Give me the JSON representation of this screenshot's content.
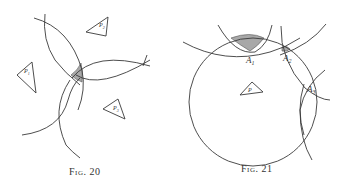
{
  "figures": [
    {
      "caption": "Fig. 20",
      "triangles": [
        {
          "label": "P",
          "sub": "1"
        },
        {
          "label": "P",
          "sub": "2"
        },
        {
          "label": "P",
          "sub": "3"
        }
      ]
    },
    {
      "caption": "Fig. 21",
      "triangle": {
        "label": "P"
      },
      "points": [
        {
          "label": "A",
          "sub": "1"
        },
        {
          "label": "A",
          "sub": "2"
        },
        {
          "label": "A",
          "sub": "3"
        }
      ]
    }
  ]
}
